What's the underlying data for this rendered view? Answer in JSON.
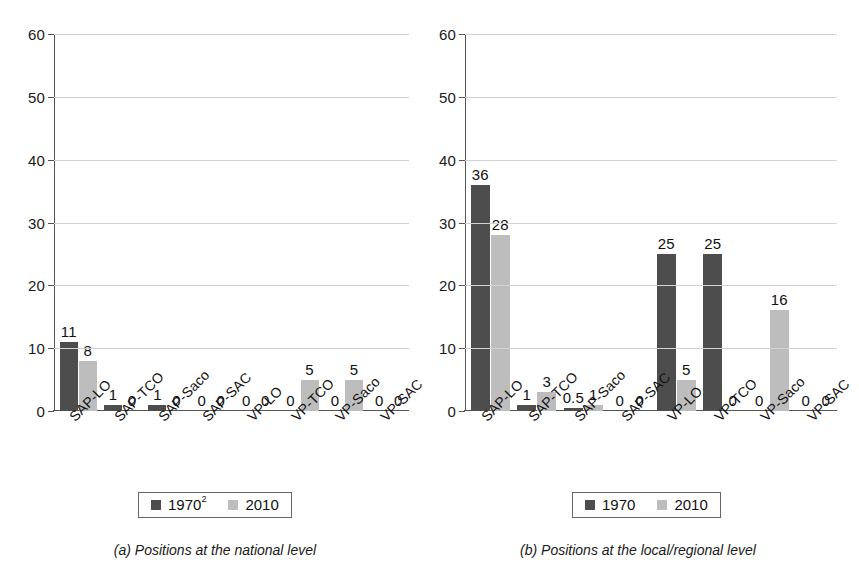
{
  "figure": {
    "panels": [
      {
        "id": "a",
        "caption": "(a) Positions at the national level",
        "legend": {
          "items": [
            {
              "label": "1970",
              "superscript": "2",
              "color": "#4d4d4d"
            },
            {
              "label": "2010",
              "superscript": "",
              "color": "#bdbdbd"
            }
          ]
        },
        "chart_data": {
          "type": "bar",
          "title": "",
          "subtitle": "",
          "xlabel": "",
          "ylabel": "",
          "ylim": [
            0,
            60
          ],
          "yticks": [
            0,
            10,
            20,
            30,
            40,
            50,
            60
          ],
          "ytick_labels": [
            "0",
            "10",
            "20",
            "30",
            "40",
            "50",
            "60"
          ],
          "grid": true,
          "legend_position": "bottom-center",
          "categories": [
            "SAP-LO",
            "SAP-TCO",
            "SAP-Saco",
            "SAP-SAC",
            "VP-LO",
            "VP-TCO",
            "VP-Saco",
            "VP-SAC"
          ],
          "series": [
            {
              "name": "1970",
              "color": "#4d4d4d",
              "values": [
                11,
                1,
                1,
                0,
                0,
                0,
                0,
                0
              ],
              "data_labels": [
                "11",
                "1",
                "1",
                "0",
                "0",
                "0",
                "0",
                "0"
              ]
            },
            {
              "name": "2010",
              "color": "#bdbdbd",
              "values": [
                8,
                0,
                0,
                0,
                0,
                5,
                5,
                0
              ],
              "data_labels": [
                "8",
                "0",
                "0",
                "0",
                "0",
                "5",
                "5",
                "0"
              ]
            }
          ]
        }
      },
      {
        "id": "b",
        "caption": "(b) Positions at the local/regional level",
        "legend": {
          "items": [
            {
              "label": "1970",
              "superscript": "",
              "color": "#4d4d4d"
            },
            {
              "label": "2010",
              "superscript": "",
              "color": "#bdbdbd"
            }
          ]
        },
        "chart_data": {
          "type": "bar",
          "title": "",
          "subtitle": "",
          "xlabel": "",
          "ylabel": "",
          "ylim": [
            0,
            60
          ],
          "yticks": [
            0,
            10,
            20,
            30,
            40,
            50,
            60
          ],
          "ytick_labels": [
            "0",
            "10",
            "20",
            "30",
            "40",
            "50",
            "60"
          ],
          "grid": true,
          "legend_position": "bottom-center",
          "categories": [
            "SAP-LO",
            "SAP-TCO",
            "SAP-Saco",
            "SAP-SAC",
            "VP-LO",
            "VP-TCO",
            "VP-Saco",
            "VP-SAC"
          ],
          "series": [
            {
              "name": "1970",
              "color": "#4d4d4d",
              "values": [
                36,
                1,
                0.5,
                0,
                25,
                25,
                0,
                0
              ],
              "data_labels": [
                "36",
                "1",
                "0.5",
                "0",
                "25",
                "25",
                "0",
                "0"
              ]
            },
            {
              "name": "2010",
              "color": "#bdbdbd",
              "values": [
                28,
                3,
                1,
                0,
                5,
                0,
                16,
                0
              ],
              "data_labels": [
                "28",
                "3",
                "1",
                "0",
                "5",
                "0",
                "16",
                "0"
              ]
            }
          ]
        }
      }
    ]
  }
}
